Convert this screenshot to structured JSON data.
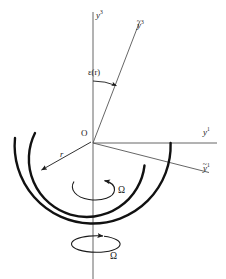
{
  "figure": {
    "background_color": "#ffffff",
    "stroke_color": "#1a1a1a",
    "thin_line_color": "#4a4a4a",
    "width": 226,
    "height": 279
  },
  "labels": {
    "axis_y3": {
      "base": "y",
      "sup": "3",
      "tilde": false
    },
    "axis_y3_tilde": {
      "base": "y",
      "sup": "3",
      "tilde": true
    },
    "axis_y1": {
      "base": "y",
      "sup": "1",
      "tilde": false
    },
    "axis_y1_tilde": {
      "base": "y",
      "sup": "1",
      "tilde": true
    },
    "origin": "O",
    "tilt_angle": "ε(r)",
    "radius": "r",
    "omega_inner": "Ω",
    "omega_axis": "Ω"
  },
  "geometry": {
    "origin": {
      "x": 93,
      "y": 143
    },
    "vertical_axis": {
      "x": 93,
      "top": 12,
      "bottom": 279
    },
    "horizontal_axis": {
      "y": 143,
      "left": 93,
      "right": 216
    },
    "tilted_axis_y3": {
      "from_x": 93,
      "from_y": 143,
      "to_x": 139,
      "to_y": 23
    },
    "tilted_axis_y1": {
      "from_x": 93,
      "from_y": 143,
      "to_x": 208,
      "to_y": 172
    },
    "inner_arc_radius": 58,
    "outer_arc_radius": 78,
    "tilt_angle_degrees": 21
  }
}
